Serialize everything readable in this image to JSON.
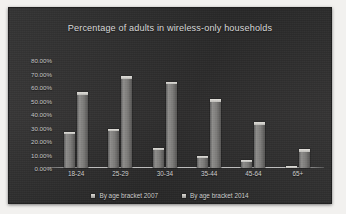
{
  "chart_data": {
    "type": "bar",
    "title": "Percentage of adults in wireless-only households",
    "xlabel": "",
    "ylabel": "",
    "categories": [
      "18-24",
      "25-29",
      "30-34",
      "35-44",
      "45-64",
      "65+"
    ],
    "series": [
      {
        "name": "By age bracket 2007",
        "values": [
          27,
          29,
          15,
          9,
          6,
          1.5
        ]
      },
      {
        "name": "By age bracket 2014",
        "values": [
          56,
          68,
          64,
          51,
          34,
          14
        ]
      }
    ],
    "ylim": [
      0,
      80
    ],
    "yticks": [
      80,
      70,
      60,
      50,
      40,
      30,
      20,
      10,
      0
    ],
    "ytick_labels": [
      "80.00%",
      "70.00%",
      "60.00%",
      "50.00%",
      "40.00%",
      "30.00%",
      "20.00%",
      "10.00%",
      "0.00%"
    ],
    "grid": false,
    "legend_position": "bottom",
    "colors": {
      "panel_background": "#2e2e2e",
      "bar": "#8e8d8b",
      "text": "#cfcfcf",
      "axis": "#e1e1e1"
    }
  }
}
